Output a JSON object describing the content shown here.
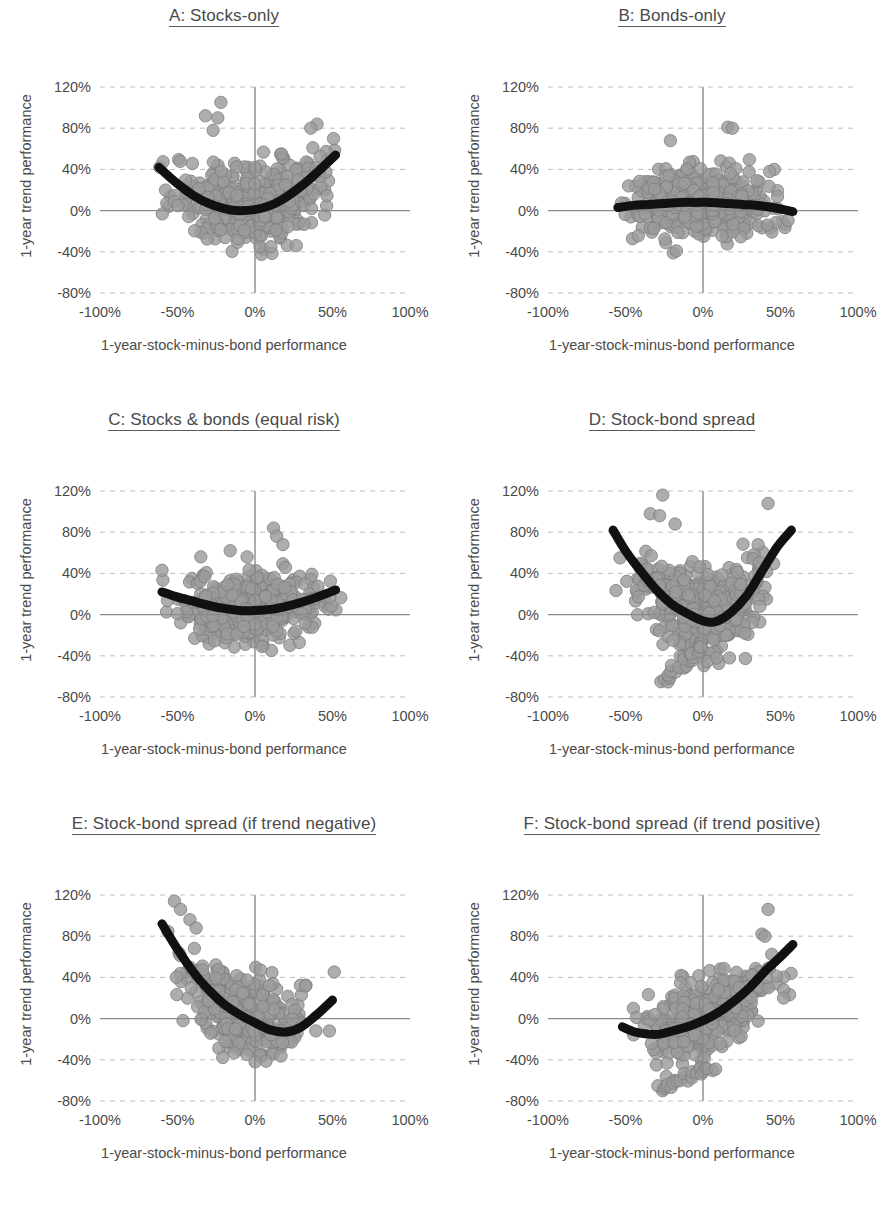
{
  "figure": {
    "layout": "2 columns x 3 rows",
    "shared_xlabel": "1-year-stock-minus-bond performance",
    "shared_ylabel": "1-year trend performance",
    "marker_color": "#9b9b9b",
    "trend_color": "#111111",
    "grid_color": "#b9bfc9",
    "axis_color": "#8a8a8a"
  },
  "axes": {
    "xticks": [
      "-100%",
      "-50%",
      "0%",
      "50%",
      "100%"
    ],
    "xtick_values": [
      -100,
      -50,
      0,
      50,
      100
    ],
    "yticks": [
      "120%",
      "80%",
      "40%",
      "0%",
      "-40%",
      "-80%"
    ],
    "ytick_values": [
      120,
      80,
      40,
      0,
      -40,
      -80
    ],
    "xlim": [
      -100,
      100
    ],
    "ylim": [
      -80,
      120
    ],
    "grid": "horizontal dashed",
    "zero_axes": "solid crosshair at x=0 and y=0"
  },
  "chart_data": [
    {
      "type": "scatter",
      "panel": "A",
      "title": "A: Stocks-only",
      "xlabel": "1-year-stock-minus-bond performance",
      "ylabel": "1-year trend performance",
      "xlim": [
        -100,
        100
      ],
      "ylim": [
        -80,
        120
      ],
      "trend_shape": "shallow upward parabola (U)",
      "trend_points": [
        [
          -62,
          42
        ],
        [
          -50,
          26
        ],
        [
          -40,
          15
        ],
        [
          -30,
          7
        ],
        [
          -20,
          2
        ],
        [
          -12,
          0
        ],
        [
          0,
          1
        ],
        [
          10,
          5
        ],
        [
          20,
          13
        ],
        [
          30,
          24
        ],
        [
          40,
          37
        ],
        [
          52,
          54
        ]
      ],
      "cloud": {
        "x_center": -2,
        "x_spread": 24,
        "y_center": 12,
        "y_spread": 26,
        "x_range": [
          -62,
          55
        ],
        "y_range": [
          -48,
          108
        ],
        "n": 430
      },
      "outliers": [
        [
          -32,
          92
        ],
        [
          -22,
          105
        ],
        [
          -24,
          90
        ],
        [
          -27,
          78
        ],
        [
          40,
          84
        ],
        [
          36,
          80
        ]
      ]
    },
    {
      "type": "scatter",
      "panel": "B",
      "title": "B: Bonds-only",
      "xlabel": "1-year-stock-minus-bond performance",
      "ylabel": "1-year trend performance",
      "xlim": [
        -100,
        100
      ],
      "ylim": [
        -80,
        120
      ],
      "trend_shape": "nearly flat, slightly domed near 6%",
      "trend_points": [
        [
          -55,
          3
        ],
        [
          -45,
          5
        ],
        [
          -35,
          6
        ],
        [
          -25,
          7
        ],
        [
          -15,
          8
        ],
        [
          -5,
          8
        ],
        [
          5,
          8
        ],
        [
          15,
          7
        ],
        [
          25,
          6
        ],
        [
          35,
          5
        ],
        [
          45,
          3
        ],
        [
          58,
          -1
        ]
      ],
      "cloud": {
        "x_center": -1,
        "x_spread": 21,
        "y_center": 5,
        "y_spread": 23,
        "x_range": [
          -56,
          60
        ],
        "y_range": [
          -46,
          80
        ],
        "n": 420
      },
      "outliers": [
        [
          16,
          81
        ],
        [
          19,
          80
        ],
        [
          -21,
          68
        ],
        [
          -48,
          24
        ],
        [
          46,
          40
        ],
        [
          43,
          38
        ]
      ]
    },
    {
      "type": "scatter",
      "panel": "C",
      "title": "C: Stocks & bonds (equal risk)",
      "xlabel": "1-year-stock-minus-bond performance",
      "ylabel": "1-year trend performance",
      "xlim": [
        -100,
        100
      ],
      "ylim": [
        -80,
        120
      ],
      "trend_shape": "shallow U with raised floor",
      "trend_points": [
        [
          -60,
          22
        ],
        [
          -50,
          17
        ],
        [
          -40,
          13
        ],
        [
          -30,
          9
        ],
        [
          -20,
          6
        ],
        [
          -10,
          4
        ],
        [
          0,
          4
        ],
        [
          10,
          5
        ],
        [
          20,
          8
        ],
        [
          30,
          12
        ],
        [
          40,
          17
        ],
        [
          52,
          24
        ]
      ],
      "cloud": {
        "x_center": -2,
        "x_spread": 22,
        "y_center": 8,
        "y_spread": 21,
        "x_range": [
          -60,
          56
        ],
        "y_range": [
          -40,
          86
        ],
        "n": 420
      },
      "outliers": [
        [
          12,
          84
        ],
        [
          14,
          76
        ],
        [
          18,
          68
        ],
        [
          -35,
          56
        ],
        [
          -16,
          62
        ],
        [
          -60,
          43
        ]
      ]
    },
    {
      "type": "scatter",
      "panel": "D",
      "title": "D: Stock-bond spread",
      "xlabel": "1-year-stock-minus-bond performance",
      "ylabel": "1-year trend performance",
      "xlim": [
        -100,
        100
      ],
      "ylim": [
        -80,
        120
      ],
      "trend_shape": "deep upward parabola (steep U)",
      "trend_points": [
        [
          -58,
          82
        ],
        [
          -50,
          62
        ],
        [
          -40,
          42
        ],
        [
          -30,
          24
        ],
        [
          -20,
          10
        ],
        [
          -10,
          1
        ],
        [
          0,
          -6
        ],
        [
          8,
          -7
        ],
        [
          18,
          2
        ],
        [
          28,
          18
        ],
        [
          38,
          42
        ],
        [
          48,
          66
        ],
        [
          57,
          82
        ]
      ],
      "cloud": {
        "x_center": 0,
        "x_spread": 20,
        "y_center": 16,
        "y_spread": 28,
        "x_range": [
          -58,
          58
        ],
        "y_range": [
          -70,
          116
        ],
        "n": 450
      },
      "tail": "diagonal strand from (-26,-66) up to (2,-30)",
      "outliers": [
        [
          -26,
          116
        ],
        [
          42,
          108
        ],
        [
          -34,
          98
        ],
        [
          -28,
          96
        ],
        [
          -18,
          88
        ]
      ]
    },
    {
      "type": "scatter",
      "panel": "E",
      "title": "E: Stock-bond spread (if trend negative)",
      "xlabel": "1-year-stock-minus-bond performance",
      "ylabel": "1-year trend performance",
      "xlim": [
        -100,
        100
      ],
      "ylim": [
        -80,
        120
      ],
      "trend_shape": "steep descent flattening to shallow rise (J reversed)",
      "trend_points": [
        [
          -60,
          92
        ],
        [
          -52,
          72
        ],
        [
          -44,
          54
        ],
        [
          -36,
          38
        ],
        [
          -28,
          25
        ],
        [
          -20,
          14
        ],
        [
          -10,
          4
        ],
        [
          0,
          -4
        ],
        [
          10,
          -11
        ],
        [
          20,
          -13
        ],
        [
          30,
          -8
        ],
        [
          40,
          4
        ],
        [
          50,
          18
        ]
      ],
      "cloud": {
        "x_center": -8,
        "x_spread": 18,
        "y_center": 10,
        "y_spread": 26,
        "x_range": [
          -58,
          52
        ],
        "y_range": [
          -48,
          116
        ],
        "n": 360,
        "correlation": "strong negative"
      },
      "outliers": [
        [
          -52,
          114
        ],
        [
          -48,
          106
        ],
        [
          -42,
          96
        ],
        [
          -38,
          88
        ],
        [
          48,
          -12
        ]
      ]
    },
    {
      "type": "scatter",
      "panel": "F",
      "title": "F: Stock-bond spread (if trend positive)",
      "xlabel": "1-year-stock-minus-bond performance",
      "ylabel": "1-year trend performance",
      "xlim": [
        -100,
        100
      ],
      "ylim": [
        -80,
        120
      ],
      "trend_shape": "flat then accelerating rise",
      "trend_points": [
        [
          -52,
          -8
        ],
        [
          -44,
          -13
        ],
        [
          -36,
          -15
        ],
        [
          -28,
          -15
        ],
        [
          -20,
          -12
        ],
        [
          -10,
          -8
        ],
        [
          0,
          -2
        ],
        [
          10,
          6
        ],
        [
          20,
          17
        ],
        [
          30,
          30
        ],
        [
          40,
          46
        ],
        [
          50,
          60
        ],
        [
          58,
          72
        ]
      ],
      "cloud": {
        "x_center": 2,
        "x_spread": 19,
        "y_center": 4,
        "y_spread": 22,
        "x_range": [
          -52,
          60
        ],
        "y_range": [
          -70,
          106
        ],
        "n": 380,
        "correlation": "strong positive"
      },
      "tail": "diagonal strand from (-26,-68) up to (6,-46)",
      "outliers": [
        [
          42,
          106
        ],
        [
          38,
          82
        ],
        [
          40,
          80
        ],
        [
          52,
          28
        ],
        [
          52,
          20
        ]
      ]
    }
  ]
}
